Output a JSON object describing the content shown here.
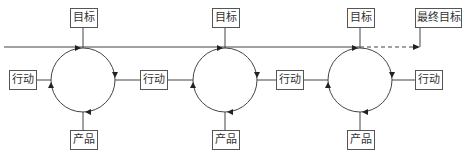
{
  "diagram": {
    "type": "iterative-cycle-flow",
    "timeline": {
      "solid_from_x": 4,
      "solid_to_x": 360,
      "dashed_to_x": 420,
      "y": 47
    },
    "cycles": [
      {
        "goal_label": "目标",
        "action_in_label": "行动",
        "product_label": "产品"
      },
      {
        "goal_label": "目标",
        "action_in_label": "行动",
        "product_label": "产品"
      },
      {
        "goal_label": "目标",
        "action_in_label": "行动",
        "action_out_label": "行动",
        "product_label": "产品"
      }
    ],
    "final_goal_label": "最终目标",
    "colors": {
      "line": "#444444",
      "box_border": "#555555",
      "text": "#333333"
    }
  }
}
